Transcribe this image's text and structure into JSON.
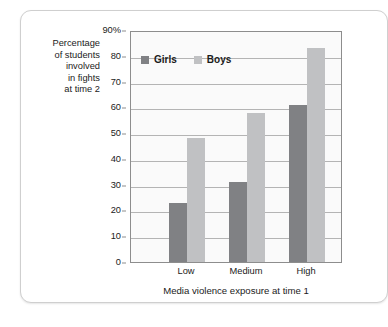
{
  "chart_data": {
    "type": "bar",
    "title": "",
    "categories": [
      "Low",
      "Medium",
      "High"
    ],
    "series": [
      {
        "name": "Girls",
        "values": [
          23,
          31,
          61
        ],
        "color": "#808184"
      },
      {
        "name": "Boys",
        "values": [
          48,
          58,
          83
        ],
        "color": "#c0c1c3"
      }
    ],
    "xlabel": "Media violence exposure at time 1",
    "ylabel": "Percentage\nof students\ninvolved\nin fights\nat time 2",
    "ylim": [
      0,
      90
    ],
    "y_ticks": [
      0,
      10,
      20,
      30,
      40,
      50,
      60,
      70,
      80,
      90
    ],
    "y_tick_labels": [
      "0",
      "10",
      "20",
      "30",
      "40",
      "50",
      "60",
      "70",
      "80",
      "90%"
    ],
    "grid": true,
    "legend_position": "top-left-inside",
    "plot_background": "#fafafa",
    "gridline_color": "#b4b4b4",
    "axis_color": "#8d8d8d"
  },
  "legend": {
    "entries": [
      {
        "label": "Girls",
        "swatch_name": "legend-swatch-girls"
      },
      {
        "label": "Boys",
        "swatch_name": "legend-swatch-boys"
      }
    ]
  },
  "axes": {
    "y_caption": "Percentage\nof students\ninvolved\nin fights\nat time 2",
    "x_title": "Media violence exposure at time 1"
  }
}
